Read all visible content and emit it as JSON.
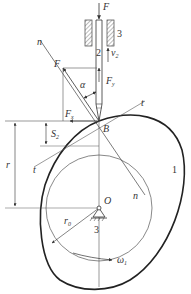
{
  "diagram": {
    "type": "cam-follower mechanism (knife-edge translating follower, disk cam)",
    "colors": {
      "line": "#333333",
      "background": "#ffffff",
      "hatch": "#555555"
    },
    "labels": {
      "force_top": "F",
      "guide_number": "3",
      "follower_number": "2",
      "velocity": "v",
      "velocity_sub": "2",
      "normal_top": "n",
      "force_normal": "F",
      "pressure_angle": "α",
      "force_y": "F",
      "force_y_sub": "y",
      "force_x": "F",
      "force_x_sub": "x",
      "tangent_right": "t",
      "tangent_left": "t",
      "contact_point": "B",
      "displacement": "S",
      "displacement_sub": "2",
      "radius": "r",
      "cam_number": "1",
      "normal_bottom": "n",
      "center": "O",
      "base_radius": "r",
      "base_radius_sub": "0",
      "frame_number": "3",
      "angular_velocity": "ω",
      "angular_velocity_sub": "1"
    }
  }
}
